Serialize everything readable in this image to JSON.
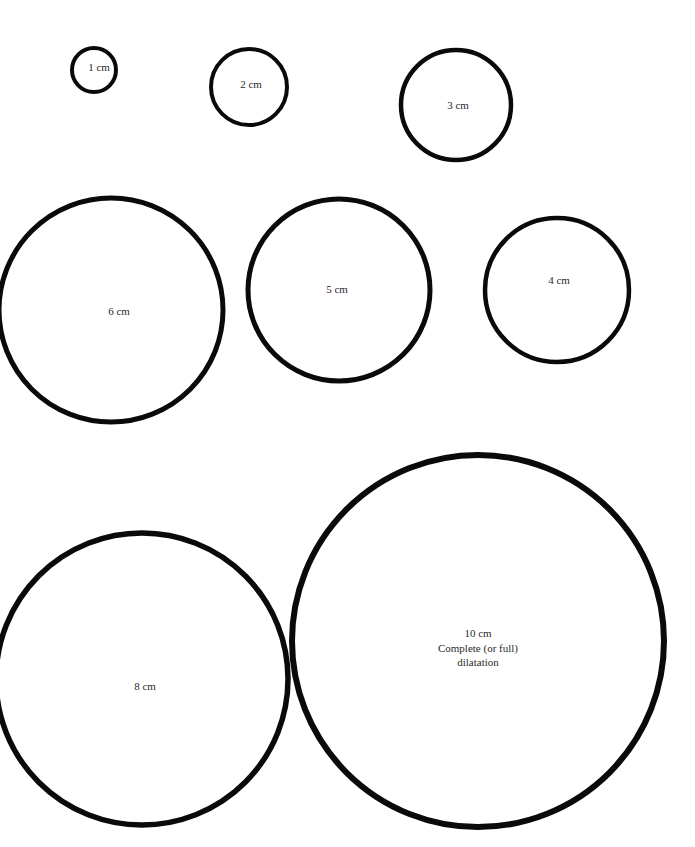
{
  "page": {
    "background_color": "#ffffff",
    "stroke_color": "#0a0a0a",
    "label_color": "#2a2a2a",
    "width": 695,
    "height": 847
  },
  "chart_data": {
    "type": "diagram",
    "subtitle": "",
    "xlabel": "",
    "ylabel": "",
    "units": "cm",
    "categories": [
      "1 cm",
      "2 cm",
      "3 cm",
      "4 cm",
      "5 cm",
      "6 cm",
      "8 cm",
      "10 cm"
    ],
    "values": [
      1,
      2,
      3,
      4,
      5,
      6,
      8,
      10
    ],
    "circles": [
      {
        "id": "circle-1cm",
        "label": "1 cm",
        "diameter_cm": 1,
        "cx": 94,
        "cy": 70,
        "r": 22,
        "stroke_width": 4,
        "label_x": 99,
        "label_y": 68,
        "clipped": false,
        "notes": []
      },
      {
        "id": "circle-2cm",
        "label": "2 cm",
        "diameter_cm": 2,
        "cx": 249,
        "cy": 87,
        "r": 38,
        "stroke_width": 4,
        "label_x": 251,
        "label_y": 85,
        "clipped": false,
        "notes": []
      },
      {
        "id": "circle-3cm",
        "label": "3 cm",
        "diameter_cm": 3,
        "cx": 456,
        "cy": 105,
        "r": 55,
        "stroke_width": 4.5,
        "label_x": 458,
        "label_y": 106,
        "clipped": false,
        "notes": []
      },
      {
        "id": "circle-4cm",
        "label": "4 cm",
        "diameter_cm": 4,
        "cx": 557,
        "cy": 290,
        "r": 72,
        "stroke_width": 4.5,
        "label_x": 559,
        "label_y": 281,
        "clipped": false,
        "notes": []
      },
      {
        "id": "circle-5cm",
        "label": "5 cm",
        "diameter_cm": 5,
        "cx": 339,
        "cy": 290,
        "r": 91,
        "stroke_width": 5,
        "label_x": 337,
        "label_y": 290,
        "clipped": false,
        "notes": []
      },
      {
        "id": "circle-6cm",
        "label": "6 cm",
        "diameter_cm": 6,
        "cx": 111,
        "cy": 310,
        "r": 112,
        "stroke_width": 5,
        "label_x": 119,
        "label_y": 312,
        "clipped": true,
        "notes": []
      },
      {
        "id": "circle-8cm",
        "label": "8 cm",
        "diameter_cm": 8,
        "cx": 142,
        "cy": 679,
        "r": 146,
        "stroke_width": 5.5,
        "label_x": 145,
        "label_y": 687,
        "clipped": true,
        "notes": []
      },
      {
        "id": "circle-10cm",
        "label": "10 cm",
        "diameter_cm": 10,
        "cx": 478,
        "cy": 641,
        "r": 186,
        "stroke_width": 6,
        "label_x": 478,
        "label_y": 634,
        "clipped": false,
        "notes": [
          "Complete (or full)",
          "dilatation"
        ]
      }
    ]
  }
}
